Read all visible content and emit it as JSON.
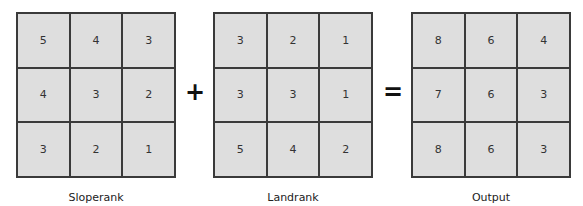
{
  "grids": [
    {
      "label": "Sloperank",
      "cells": [
        "5",
        "4",
        "3",
        "4",
        "3",
        "2",
        "3",
        "2",
        "1"
      ]
    },
    {
      "label": "Landrank",
      "cells": [
        "3",
        "2",
        "1",
        "3",
        "3",
        "1",
        "5",
        "4",
        "2"
      ]
    },
    {
      "label": "Output",
      "cells": [
        "8",
        "6",
        "4",
        "7",
        "6",
        "3",
        "8",
        "6",
        "3"
      ]
    }
  ],
  "operators": {
    "plus": "+",
    "equals": "="
  }
}
